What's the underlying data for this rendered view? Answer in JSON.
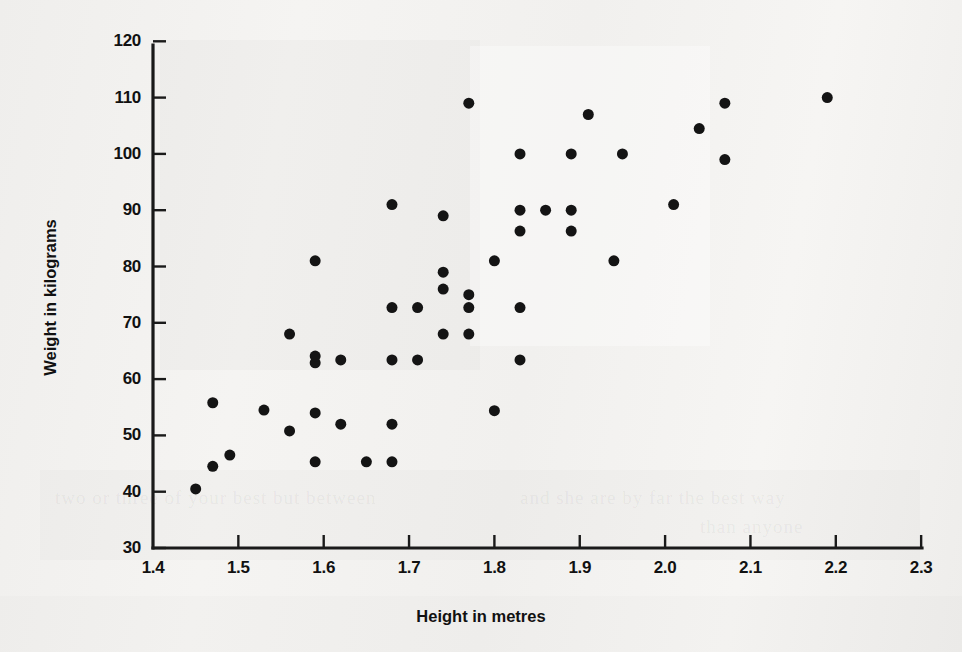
{
  "chart_data": {
    "type": "scatter",
    "title": "",
    "subtitle": "",
    "xlabel": "Height in metres",
    "ylabel": "Weight in kilograms",
    "xlim": [
      1.4,
      2.3
    ],
    "ylim": [
      30,
      125
    ],
    "xticks": [
      "1.4",
      "1.5",
      "1.6",
      "1.7",
      "1.8",
      "1.9",
      "2.0",
      "2.1",
      "2.2",
      "2.3"
    ],
    "xtick_values": [
      1.4,
      1.5,
      1.6,
      1.7,
      1.8,
      1.9,
      2.0,
      2.1,
      2.2,
      2.3
    ],
    "yticks": [
      "30",
      "40",
      "50",
      "60",
      "70",
      "80",
      "90",
      "100",
      "110",
      "120"
    ],
    "ytick_values": [
      30,
      40,
      50,
      60,
      70,
      80,
      90,
      100,
      110,
      120
    ],
    "grid": false,
    "legend": false,
    "marker": "filled-circle",
    "marker_color": "#141414",
    "marker_size": 11,
    "series": [
      {
        "name": "Height vs Weight",
        "points": [
          [
            1.45,
            40.5
          ],
          [
            1.47,
            44.5
          ],
          [
            1.49,
            46.5
          ],
          [
            1.47,
            55.8
          ],
          [
            1.53,
            54.5
          ],
          [
            1.56,
            50.8
          ],
          [
            1.56,
            68.0
          ],
          [
            1.59,
            45.3
          ],
          [
            1.59,
            54.0
          ],
          [
            1.59,
            62.9
          ],
          [
            1.59,
            64.1
          ],
          [
            1.59,
            81.0
          ],
          [
            1.62,
            63.4
          ],
          [
            1.62,
            52.0
          ],
          [
            1.65,
            45.3
          ],
          [
            1.68,
            45.3
          ],
          [
            1.68,
            52.0
          ],
          [
            1.68,
            63.4
          ],
          [
            1.68,
            72.7
          ],
          [
            1.68,
            91.0
          ],
          [
            1.71,
            63.4
          ],
          [
            1.71,
            72.7
          ],
          [
            1.74,
            68.0
          ],
          [
            1.74,
            76.0
          ],
          [
            1.74,
            79.0
          ],
          [
            1.74,
            89.0
          ],
          [
            1.77,
            68.0
          ],
          [
            1.77,
            72.7
          ],
          [
            1.77,
            75.0
          ],
          [
            1.77,
            109.0
          ],
          [
            1.8,
            54.4
          ],
          [
            1.8,
            81.0
          ],
          [
            1.83,
            63.4
          ],
          [
            1.83,
            72.7
          ],
          [
            1.83,
            86.3
          ],
          [
            1.83,
            90.0
          ],
          [
            1.83,
            100.0
          ],
          [
            1.86,
            90.0
          ],
          [
            1.89,
            86.3
          ],
          [
            1.89,
            90.0
          ],
          [
            1.89,
            100.0
          ],
          [
            1.91,
            107.0
          ],
          [
            1.94,
            81.0
          ],
          [
            1.95,
            100.0
          ],
          [
            2.01,
            91.0
          ],
          [
            2.04,
            104.5
          ],
          [
            2.07,
            99.0
          ],
          [
            2.07,
            109.0
          ],
          [
            2.19,
            110.0
          ]
        ]
      }
    ]
  },
  "figure": {
    "background_color": "#f3f2f0",
    "axis_color": "#1a1a1a",
    "text_color": "#111111"
  },
  "ghost": {
    "line_one": "two or three of your best but between",
    "line_two": "and she are by far the best way",
    "line_three": "than anyone"
  }
}
